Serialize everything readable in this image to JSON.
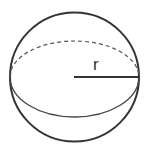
{
  "diagram": {
    "type": "sphere",
    "label_radius": "r",
    "colors": {
      "stroke": "#333333",
      "background": "#ffffff"
    }
  }
}
